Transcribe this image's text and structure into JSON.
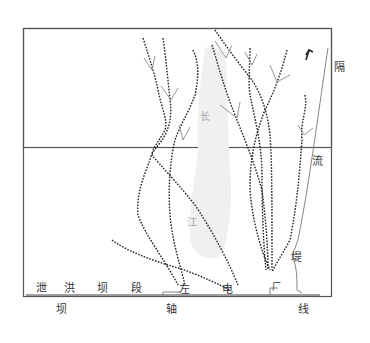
{
  "diagram": {
    "type": "flow-trace-map",
    "labels": {
      "isolation_wall": [
        "隔",
        "流",
        "堤"
      ],
      "river": [
        "长",
        "江"
      ],
      "spillway_section": [
        "泄",
        "洪",
        "坝",
        "段"
      ],
      "left_powerhouse": [
        "左",
        "电",
        "厂"
      ],
      "dam_axis": [
        "坝",
        "轴",
        "线"
      ]
    },
    "colors": {
      "frame": "#555555",
      "trace": "#222222",
      "island": "#f0f0f0",
      "arrow": "#888888"
    },
    "traces_count": 8
  }
}
